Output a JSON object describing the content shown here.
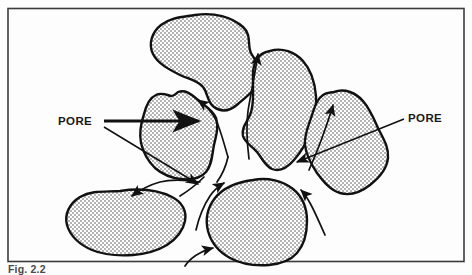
{
  "figure": {
    "caption": "Fig. 2.2",
    "border_color": "#3b3b3b",
    "background_color": "#fdfdfd",
    "grain_fill_color": "#c9c9c9",
    "outline_color": "#111111"
  },
  "labels": {
    "pore_left": "PORE",
    "pore_right": "PORE"
  },
  "icons": {
    "flow_arrow": "flow-arrow-icon",
    "leader_arrow": "leader-arrow-icon"
  },
  "diagram": {
    "grains": [
      {
        "name": "grain-top-center"
      },
      {
        "name": "grain-upper-right"
      },
      {
        "name": "grain-right"
      },
      {
        "name": "grain-left-center"
      },
      {
        "name": "grain-bottom-left"
      },
      {
        "name": "grain-bottom-center"
      }
    ],
    "flow_arrows": [
      {
        "name": "flow-arrow-upper-left"
      },
      {
        "name": "flow-arrow-upper-right"
      },
      {
        "name": "flow-arrow-right-upper"
      },
      {
        "name": "flow-arrow-center-left"
      },
      {
        "name": "flow-arrow-center-down"
      },
      {
        "name": "flow-arrow-lower-left"
      },
      {
        "name": "flow-arrow-lower-center"
      },
      {
        "name": "flow-arrow-bottom-center"
      },
      {
        "name": "flow-arrow-bottom-right"
      }
    ]
  }
}
